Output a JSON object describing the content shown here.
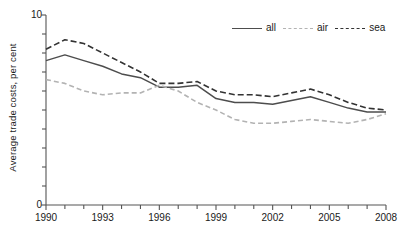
{
  "chart_data": {
    "type": "line",
    "title": "",
    "xlabel": "",
    "ylabel": "Average trade costs, per cent",
    "xlim": [
      1990,
      2008
    ],
    "ylim": [
      0,
      10
    ],
    "ytick_labels": [
      "0",
      "10"
    ],
    "ytick_values": [
      0,
      10
    ],
    "yminor_step": 1,
    "xtick_labels": [
      "1990",
      "1993",
      "1996",
      "1999",
      "2002",
      "2005",
      "2008"
    ],
    "xtick_values": [
      1990,
      1993,
      1996,
      1999,
      2002,
      2005,
      2008
    ],
    "xminor_step": 1,
    "grid": false,
    "legend_position": "top-right",
    "x": [
      1990,
      1991,
      1992,
      1993,
      1994,
      1995,
      1996,
      1997,
      1998,
      1999,
      2000,
      2001,
      2002,
      2003,
      2004,
      2005,
      2006,
      2007,
      2008
    ],
    "series": [
      {
        "name": "all",
        "style": "solid",
        "color": "#4d4d4d",
        "values": [
          7.6,
          7.9,
          7.6,
          7.3,
          6.9,
          6.7,
          6.2,
          6.2,
          6.3,
          5.6,
          5.4,
          5.4,
          5.3,
          5.5,
          5.7,
          5.4,
          5.1,
          4.9,
          4.9
        ]
      },
      {
        "name": "air",
        "style": "dashed-light",
        "color": "#b3b3b3",
        "values": [
          6.6,
          6.4,
          6.0,
          5.8,
          5.9,
          5.9,
          6.3,
          6.0,
          5.4,
          5.0,
          4.5,
          4.3,
          4.3,
          4.4,
          4.5,
          4.4,
          4.3,
          4.5,
          4.8
        ]
      },
      {
        "name": "sea",
        "style": "dashed-dark",
        "color": "#333333",
        "values": [
          8.2,
          8.7,
          8.5,
          8.0,
          7.5,
          7.0,
          6.4,
          6.4,
          6.5,
          6.0,
          5.8,
          5.8,
          5.7,
          5.9,
          6.1,
          5.8,
          5.4,
          5.1,
          5.0
        ]
      }
    ]
  },
  "legend": {
    "items": [
      {
        "label": "all"
      },
      {
        "label": "air"
      },
      {
        "label": "sea"
      }
    ]
  },
  "axes": {
    "y_axis_title": "Average trade costs, per cent",
    "y_top_label": "10",
    "y_bottom_label": "0"
  }
}
